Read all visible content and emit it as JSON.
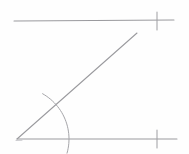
{
  "figure": {
    "title": "Parallel lines cut by a transversal",
    "background_color": "#fefefe",
    "stroke_color": "#9a9a9e",
    "canvas": {
      "width": 189,
      "height": 154
    },
    "elements": [
      {
        "name": "top-parallel-line",
        "kind": "line-segment",
        "x1": 14,
        "y1": 21,
        "x2": 174,
        "y2": 20,
        "label": "Top parallel line"
      },
      {
        "name": "bottom-parallel-line",
        "kind": "line-segment",
        "x1": 17,
        "y1": 139,
        "x2": 177,
        "y2": 139,
        "label": "Bottom parallel line"
      },
      {
        "name": "transversal-ray",
        "kind": "line-segment",
        "x1": 17,
        "y1": 139,
        "x2": 137,
        "y2": 33,
        "label": "Transversal ray"
      },
      {
        "name": "top-tick-mark",
        "kind": "tick",
        "x": 157,
        "y1": 12,
        "y2": 30,
        "label": "Tick mark on top line"
      },
      {
        "name": "bottom-tick-mark",
        "kind": "tick",
        "x": 157,
        "y1": 130,
        "y2": 148,
        "label": "Tick mark on bottom line"
      },
      {
        "name": "angle-arc",
        "kind": "arc",
        "center_x": 17,
        "center_y": 139,
        "radius": 52,
        "start_x": 43,
        "start_y": 93,
        "end_x": 70,
        "end_y": 154,
        "label": "Arc marking angle at vertex"
      },
      {
        "name": "vertex-point",
        "kind": "point",
        "x": 17,
        "y": 139,
        "label": "Vertex where transversal meets bottom line"
      }
    ],
    "annotations": {
      "tick_count_top": 1,
      "tick_count_bottom": 1,
      "parallel_marks": "single tick on each line indicates the lines are parallel"
    }
  }
}
